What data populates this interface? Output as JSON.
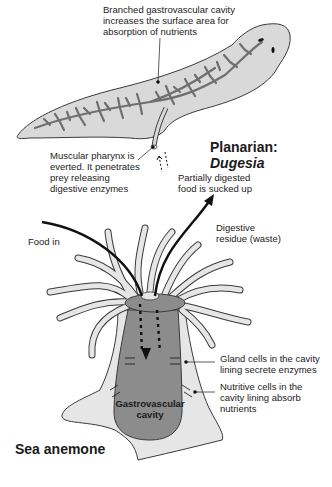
{
  "planarian": {
    "title_prefix": "Planarian: ",
    "title_genus": "Dugesia",
    "labels": {
      "branched_cavity": [
        "Branched gastrovascular cavity",
        "increases the surface area for",
        "absorption of nutrients"
      ],
      "pharynx": [
        "Muscular pharynx is",
        "everted. It penetrates",
        "prey releasing",
        "digestive enzymes"
      ],
      "food_sucked": [
        "Partially digested",
        "food is sucked up"
      ]
    }
  },
  "anemone": {
    "title": "Sea anemone",
    "labels": {
      "food_in": "Food in",
      "digestive_residue": [
        "Digestive",
        "residue (waste)"
      ],
      "gland_cells": [
        "Gland cells in the cavity",
        "lining secrete enzymes"
      ],
      "nutritive_cells": [
        "Nutritive cells in the",
        "cavity lining absorb",
        "nutrients"
      ],
      "cavity": [
        "Gastrovascular",
        "cavity"
      ]
    }
  },
  "colors": {
    "body_fill": "#d9d9d9",
    "cavity_fill": "#8c8c8c",
    "outline": "#3a3a3a",
    "tentacle_fill": "#e6e6e6",
    "arrow": "#1a1a1a"
  }
}
